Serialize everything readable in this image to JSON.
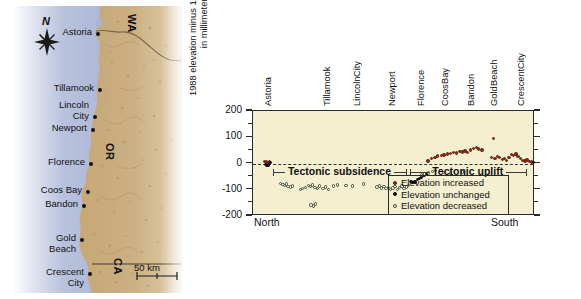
{
  "figure": {
    "map": {
      "compass_label": "N",
      "scale_label": "50 km",
      "states": [
        {
          "code": "WA",
          "x": 126,
          "y": 18
        },
        {
          "code": "OR",
          "x": 104,
          "y": 150
        },
        {
          "code": "CA",
          "x": 112,
          "y": 262
        }
      ],
      "cities": [
        {
          "name": "Astoria",
          "lines": [
            "Astoria"
          ],
          "dot_x": 96,
          "dot_y": 32,
          "label_x": 38,
          "label_y": 27
        },
        {
          "name": "Tillamook",
          "lines": [
            "Tillamook"
          ],
          "dot_x": 98,
          "dot_y": 88,
          "label_x": 31,
          "label_y": 83
        },
        {
          "name": "Lincoln City",
          "lines": [
            "Lincoln",
            "City"
          ],
          "dot_x": 93,
          "dot_y": 115,
          "label_x": 43,
          "label_y": 100
        },
        {
          "name": "Newport",
          "lines": [
            "Newport"
          ],
          "dot_x": 91,
          "dot_y": 128,
          "label_x": 33,
          "label_y": 123
        },
        {
          "name": "Florence",
          "lines": [
            "Florence"
          ],
          "dot_x": 89,
          "dot_y": 162,
          "label_x": 30,
          "label_y": 157
        },
        {
          "name": "Coos Bay",
          "lines": [
            "Coos Bay"
          ],
          "dot_x": 86,
          "dot_y": 190,
          "label_x": 28,
          "label_y": 185
        },
        {
          "name": "Bandon",
          "lines": [
            "Bandon"
          ],
          "dot_x": 82,
          "dot_y": 204,
          "label_x": 32,
          "label_y": 199
        },
        {
          "name": "Gold Beach",
          "lines": [
            "Gold",
            "Beach"
          ],
          "dot_x": 80,
          "dot_y": 238,
          "label_x": 36,
          "label_y": 233
        },
        {
          "name": "Crescent City",
          "lines": [
            "Crescent",
            "City"
          ],
          "dot_x": 88,
          "dot_y": 272,
          "label_x": 26,
          "label_y": 267
        }
      ]
    },
    "chart_data": {
      "type": "scatter",
      "title": "",
      "ylabel_lines": [
        "1988 elevation minus 1931 elevation,",
        "in millimeters"
      ],
      "ylabel": "1988 elevation minus 1931 elevation, in millimeters",
      "xlabel": "",
      "ylim": [
        -200,
        200
      ],
      "yticks": [
        200,
        100,
        0,
        -100,
        -200
      ],
      "ytick_labels": [
        "200",
        "100",
        "0",
        "-100",
        "-200"
      ],
      "y_minor_step": 50,
      "grid": false,
      "zero_reference_line": 0,
      "x_direction_left": "North",
      "x_direction_right": "South",
      "x_categories": [
        {
          "label": "Astoria",
          "lines": [
            "Astoria"
          ],
          "pos": 0.055
        },
        {
          "label": "Tillamook",
          "lines": [
            "Tillamook"
          ],
          "pos": 0.265
        },
        {
          "label": "Lincoln City",
          "lines": [
            "Lincoln",
            "City"
          ],
          "pos": 0.395
        },
        {
          "label": "Newport",
          "lines": [
            "Newport"
          ],
          "pos": 0.495
        },
        {
          "label": "Florence",
          "lines": [
            "Florence"
          ],
          "pos": 0.6
        },
        {
          "label": "Coos Bay",
          "lines": [
            "Coos",
            "Bay"
          ],
          "pos": 0.705
        },
        {
          "label": "Bandon",
          "lines": [
            "Bandon"
          ],
          "pos": 0.775
        },
        {
          "label": "Gold Beach",
          "lines": [
            "Gold",
            "Beach"
          ],
          "pos": 0.88
        },
        {
          "label": "Crescent City",
          "lines": [
            "Crescent",
            "City"
          ],
          "pos": 0.975
        }
      ],
      "annotations": [
        {
          "text": "Tectonic subsidence",
          "x_start": 0.075,
          "x_end": 0.545,
          "y": -35
        },
        {
          "text": "Tectonic uplift",
          "x_start": 0.56,
          "x_end": 0.97,
          "y": -35
        }
      ],
      "legend": {
        "position": "inside-bottom-right",
        "entries": [
          {
            "label": "Elevation increased",
            "marker": "filled-red",
            "color": "#8b2b14"
          },
          {
            "label": "Elevation unchanged",
            "marker": "filled-black",
            "color": "#151515"
          },
          {
            "label": "Elevation decreased",
            "marker": "open-circle",
            "color": "#f6f2da"
          }
        ]
      },
      "series": [
        {
          "name": "Elevation increased",
          "marker": "filled-red",
          "points": [
            [
              0.04,
              8
            ],
            [
              0.047,
              6
            ],
            [
              0.051,
              2
            ],
            [
              0.058,
              5
            ],
            [
              0.62,
              10
            ],
            [
              0.632,
              18
            ],
            [
              0.645,
              22
            ],
            [
              0.655,
              28
            ],
            [
              0.668,
              30
            ],
            [
              0.678,
              33
            ],
            [
              0.69,
              36
            ],
            [
              0.7,
              38
            ],
            [
              0.712,
              42
            ],
            [
              0.722,
              40
            ],
            [
              0.734,
              45
            ],
            [
              0.742,
              44
            ],
            [
              0.752,
              48
            ],
            [
              0.76,
              43
            ],
            [
              0.772,
              52
            ],
            [
              0.782,
              58
            ],
            [
              0.793,
              62
            ],
            [
              0.8,
              55
            ],
            [
              0.812,
              52
            ],
            [
              0.852,
              96
            ],
            [
              0.846,
              22
            ],
            [
              0.858,
              20
            ],
            [
              0.866,
              26
            ],
            [
              0.874,
              24
            ],
            [
              0.884,
              15
            ],
            [
              0.892,
              18
            ],
            [
              0.9,
              12
            ],
            [
              0.908,
              22
            ],
            [
              0.916,
              34
            ],
            [
              0.924,
              30
            ],
            [
              0.932,
              36
            ],
            [
              0.94,
              27
            ],
            [
              0.948,
              18
            ],
            [
              0.956,
              12
            ],
            [
              0.964,
              9
            ],
            [
              0.972,
              14
            ],
            [
              0.98,
              8
            ],
            [
              0.988,
              6
            ]
          ]
        },
        {
          "name": "Elevation unchanged",
          "marker": "filled-black",
          "points": [
            [
              0.044,
              -4
            ],
            [
              0.05,
              -8
            ],
            [
              0.056,
              -6
            ],
            [
              0.063,
              4
            ],
            [
              0.56,
              -68
            ],
            [
              0.568,
              -72
            ],
            [
              0.575,
              -70
            ],
            [
              0.583,
              -60
            ],
            [
              0.59,
              -58
            ],
            [
              0.598,
              -52
            ],
            [
              0.606,
              -46
            ],
            [
              0.614,
              -40
            ],
            [
              0.995,
              4
            ]
          ]
        },
        {
          "name": "Elevation decreased",
          "marker": "open-circle",
          "points": [
            [
              0.098,
              -76
            ],
            [
              0.106,
              -80
            ],
            [
              0.112,
              -84
            ],
            [
              0.118,
              -78
            ],
            [
              0.124,
              -88
            ],
            [
              0.132,
              -90
            ],
            [
              0.14,
              -86
            ],
            [
              0.168,
              -100
            ],
            [
              0.176,
              -96
            ],
            [
              0.186,
              -92
            ],
            [
              0.196,
              -84
            ],
            [
              0.204,
              -88
            ],
            [
              0.212,
              -82
            ],
            [
              0.22,
              -92
            ],
            [
              0.228,
              -96
            ],
            [
              0.236,
              -86
            ],
            [
              0.206,
              -158
            ],
            [
              0.214,
              -162
            ],
            [
              0.222,
              -154
            ],
            [
              0.248,
              -96
            ],
            [
              0.258,
              -90
            ],
            [
              0.268,
              -100
            ],
            [
              0.286,
              -86
            ],
            [
              0.3,
              -82
            ],
            [
              0.33,
              -84
            ],
            [
              0.352,
              -86
            ],
            [
              0.392,
              -78
            ],
            [
              0.44,
              -90
            ],
            [
              0.448,
              -86
            ],
            [
              0.456,
              -94
            ],
            [
              0.464,
              -88
            ],
            [
              0.472,
              -96
            ],
            [
              0.48,
              -92
            ],
            [
              0.488,
              -100
            ],
            [
              0.496,
              -94
            ],
            [
              0.504,
              -88
            ],
            [
              0.512,
              -98
            ],
            [
              0.52,
              -92
            ],
            [
              0.528,
              -86
            ],
            [
              0.536,
              -96
            ],
            [
              0.544,
              -90
            ],
            [
              0.552,
              -84
            ],
            [
              0.598,
              -44
            ],
            [
              0.608,
              -40
            ],
            [
              0.622,
              -36
            ],
            [
              0.636,
              -30
            ],
            [
              0.648,
              -26
            ],
            [
              0.676,
              -34
            ],
            [
              0.7,
              -36
            ],
            [
              0.744,
              -32
            ]
          ]
        }
      ]
    }
  }
}
